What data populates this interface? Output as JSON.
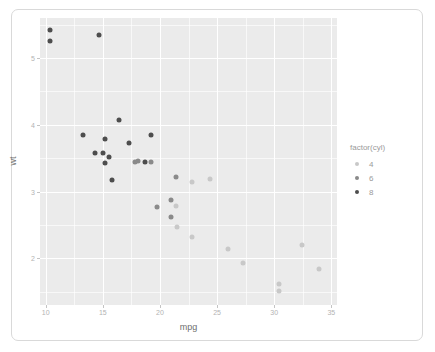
{
  "chart_data": {
    "type": "scatter",
    "title": "",
    "xlabel": "mpg",
    "ylabel": "wt",
    "xlim": [
      9.5,
      35.5
    ],
    "ylim": [
      1.3,
      5.6
    ],
    "x_ticks": [
      10,
      15,
      20,
      25,
      30,
      35
    ],
    "y_ticks": [
      2,
      3,
      4,
      5
    ],
    "x_tick_labels": [
      "10",
      "15",
      "20",
      "25",
      "30",
      "35"
    ],
    "y_tick_labels": [
      "2",
      "3",
      "4",
      "5"
    ],
    "x_minor_ticks": [
      12.5,
      17.5,
      22.5,
      27.5,
      32.5
    ],
    "y_minor_ticks": [
      1.5,
      2.5,
      3.5,
      4.5,
      5.5
    ],
    "grid": true,
    "legend": {
      "title": "factor(cyl)",
      "position": "right",
      "entries": [
        {
          "label": "4",
          "color": "#c8c8c8"
        },
        {
          "label": "6",
          "color": "#8a8a8a"
        },
        {
          "label": "8",
          "color": "#4d4d4d"
        }
      ]
    },
    "series": [
      {
        "name": "4",
        "color": "#c8c8c8",
        "points": [
          {
            "x": 22.8,
            "y": 2.32
          },
          {
            "x": 24.4,
            "y": 3.19
          },
          {
            "x": 22.8,
            "y": 3.15
          },
          {
            "x": 32.4,
            "y": 2.2
          },
          {
            "x": 30.4,
            "y": 1.615
          },
          {
            "x": 33.9,
            "y": 1.835
          },
          {
            "x": 21.5,
            "y": 2.465
          },
          {
            "x": 27.3,
            "y": 1.935
          },
          {
            "x": 26.0,
            "y": 2.14
          },
          {
            "x": 30.4,
            "y": 1.513
          },
          {
            "x": 21.4,
            "y": 2.78
          }
        ]
      },
      {
        "name": "6",
        "color": "#8a8a8a",
        "points": [
          {
            "x": 21.0,
            "y": 2.62
          },
          {
            "x": 21.0,
            "y": 2.875
          },
          {
            "x": 21.4,
            "y": 3.215
          },
          {
            "x": 18.1,
            "y": 3.46
          },
          {
            "x": 19.2,
            "y": 3.44
          },
          {
            "x": 17.8,
            "y": 3.44
          },
          {
            "x": 19.7,
            "y": 2.77
          }
        ]
      },
      {
        "name": "8",
        "color": "#4d4d4d",
        "points": [
          {
            "x": 18.7,
            "y": 3.44
          },
          {
            "x": 14.3,
            "y": 3.57
          },
          {
            "x": 16.4,
            "y": 4.07
          },
          {
            "x": 17.3,
            "y": 3.73
          },
          {
            "x": 15.2,
            "y": 3.78
          },
          {
            "x": 10.4,
            "y": 5.25
          },
          {
            "x": 10.4,
            "y": 5.424
          },
          {
            "x": 14.7,
            "y": 5.345
          },
          {
            "x": 15.5,
            "y": 3.52
          },
          {
            "x": 15.2,
            "y": 3.435
          },
          {
            "x": 13.3,
            "y": 3.84
          },
          {
            "x": 19.2,
            "y": 3.845
          },
          {
            "x": 15.8,
            "y": 3.17
          },
          {
            "x": 15.0,
            "y": 3.57
          }
        ]
      }
    ]
  }
}
